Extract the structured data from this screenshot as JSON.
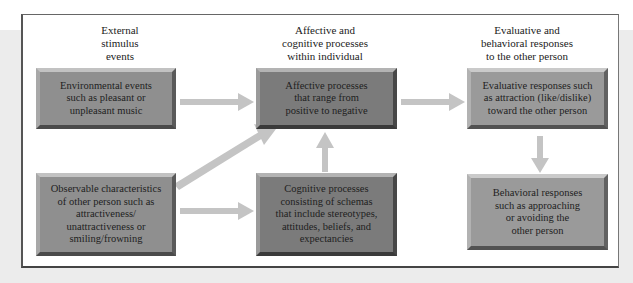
{
  "diagram": {
    "columns": [
      {
        "heading": [
          "External",
          "stimulus",
          "events"
        ]
      },
      {
        "heading": [
          "Affective and",
          "cognitive processes",
          "within individual"
        ]
      },
      {
        "heading": [
          "Evaluative and",
          "behavioral responses",
          "to the other person"
        ]
      }
    ],
    "boxes": {
      "environmental": [
        "Environmental events",
        "such as pleasant or",
        "unpleasant music"
      ],
      "observable": [
        "Observable characteristics",
        "of other person such as",
        "attractiveness/",
        "unattractiveness or",
        "smiling/frowning"
      ],
      "affective": [
        "Affective processes",
        "that range from",
        "positive to negative"
      ],
      "cognitive": [
        "Cognitive processes",
        "consisting of schemas",
        "that include stereotypes,",
        "attitudes, beliefs, and",
        "expectancies"
      ],
      "evaluative": [
        "Evaluative responses such",
        "as attraction (like/dislike)",
        "toward the other person"
      ],
      "behavioral": [
        "Behavioral responses",
        "such as approaching",
        "or avoiding the",
        "other person"
      ]
    },
    "edges": [
      {
        "from": "environmental",
        "to": "affective"
      },
      {
        "from": "observable",
        "to": "affective"
      },
      {
        "from": "observable",
        "to": "cognitive"
      },
      {
        "from": "cognitive",
        "to": "affective"
      },
      {
        "from": "affective",
        "to": "evaluative"
      },
      {
        "from": "evaluative",
        "to": "behavioral"
      }
    ],
    "colors": {
      "arrow": "#c4c4c4",
      "box_fill": "#8f8f8f",
      "box_fill_dark": "#7b7b7b",
      "frame_border": "#555555",
      "background_band": "#ececec"
    }
  }
}
